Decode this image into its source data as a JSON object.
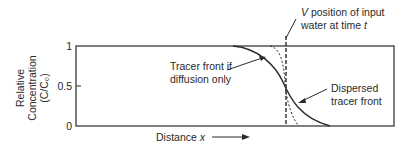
{
  "diagram": {
    "y_axis": {
      "label_lines": [
        "Relative",
        "Concentration",
        "(C/C₀)"
      ],
      "ticks": [
        "1",
        "0.5",
        "0"
      ]
    },
    "x_axis": {
      "label": "Distance x",
      "arrow": "right-arrow"
    },
    "annotations": {
      "input_water": {
        "line1": "V position of input",
        "line2": "water at time t"
      },
      "diffusion_only": {
        "line1": "Tracer front if",
        "line2": "diffusion only"
      },
      "dispersed": {
        "line1": "Dispersed",
        "line2": "tracer front"
      }
    },
    "colors": {
      "line": "#2a2a2a",
      "background": "#ffffff"
    }
  }
}
